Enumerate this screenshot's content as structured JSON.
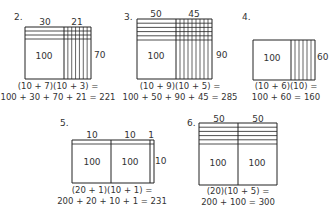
{
  "problems": [
    {
      "number": "2.",
      "top_labels": [
        "30",
        "21"
      ],
      "side_label": "70",
      "inner_labels": [
        "100"
      ],
      "equation_line1": "(10 + 7)(10 + 3) =",
      "equation_line2": "100 + 30 + 70 + 21 = 221",
      "geometry": {
        "x": 25,
        "y": 27,
        "w": 66,
        "h": 52,
        "splits_x": [
          64
        ],
        "top_strips": 3,
        "strip_h": 4,
        "right_verticals": 7
      }
    },
    {
      "number": "3.",
      "top_labels": [
        "50",
        "45"
      ],
      "side_label": "90",
      "inner_labels": [
        "100"
      ],
      "equation_line1": "(10 + 9)(10 + 5) =",
      "equation_line2": "100 + 50 + 90 + 45 = 285",
      "geometry": {
        "x": 137,
        "y": 19,
        "w": 75,
        "h": 60,
        "splits_x": [
          176
        ],
        "top_strips": 5,
        "strip_h": 4.2,
        "right_verticals": 9
      }
    },
    {
      "number": "4.",
      "top_labels": [],
      "side_label": "60",
      "inner_labels": [
        "100"
      ],
      "equation_line1": "(10 + 6)(10) =",
      "equation_line2": "100 + 60 = 160",
      "geometry": {
        "x": 253,
        "y": 40,
        "w": 62,
        "h": 40,
        "splits_x": [
          291
        ],
        "top_strips": 0,
        "strip_h": 0,
        "right_verticals": 6
      }
    },
    {
      "number": "5.",
      "top_labels": [
        "10",
        "10",
        "1"
      ],
      "side_label": "10",
      "inner_labels": [
        "100",
        "100"
      ],
      "equation_line1": "(20 + 1)(10 + 1) =",
      "equation_line2": "200 + 20 + 10 + 1 = 231",
      "geometry": {
        "x": 72,
        "y": 140,
        "w": 82,
        "h": 43,
        "splits_x": [
          111,
          150
        ],
        "top_strips": 1,
        "strip_h": 4,
        "right_verticals": 0
      }
    },
    {
      "number": "6.",
      "top_labels": [
        "50",
        "50"
      ],
      "side_label": "",
      "inner_labels": [
        "100",
        "100"
      ],
      "equation_line1": "(20)(10 + 5) =",
      "equation_line2": "200 + 100 = 300",
      "geometry": {
        "x": 199,
        "y": 123,
        "w": 78,
        "h": 62,
        "splits_x": [
          238
        ],
        "top_strips": 5,
        "strip_h": 4.2,
        "right_verticals": 0
      }
    }
  ],
  "colors": {
    "line": "#222222",
    "text": "#333333",
    "background": "#ffffff"
  }
}
